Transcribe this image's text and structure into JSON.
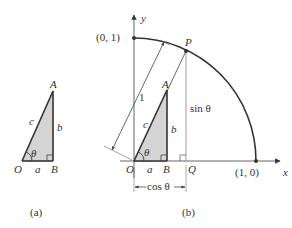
{
  "figure_a": {
    "caption": "(a)",
    "vertices": {
      "O": "O",
      "A": "A",
      "B": "B"
    },
    "sides": {
      "hypotenuse": "c",
      "opposite": "b",
      "adjacent": "a"
    },
    "angle": "θ"
  },
  "figure_b": {
    "caption": "(b)",
    "axes": {
      "x": "x",
      "y": "y"
    },
    "points": {
      "origin": "O",
      "P": "P",
      "Q": "Q",
      "A": "A",
      "B": "B",
      "unit_y": "(0, 1)",
      "unit_x": "(1, 0)"
    },
    "sides": {
      "hypotenuse": "c",
      "opposite": "b",
      "adjacent": "a"
    },
    "angle": "θ",
    "radius_label": "1",
    "sin_label": "sin θ",
    "cos_label": "cos θ"
  },
  "colors": {
    "stroke": "#333333",
    "fill_triangle": "#d4d4d4",
    "thin_line": "#666666"
  }
}
